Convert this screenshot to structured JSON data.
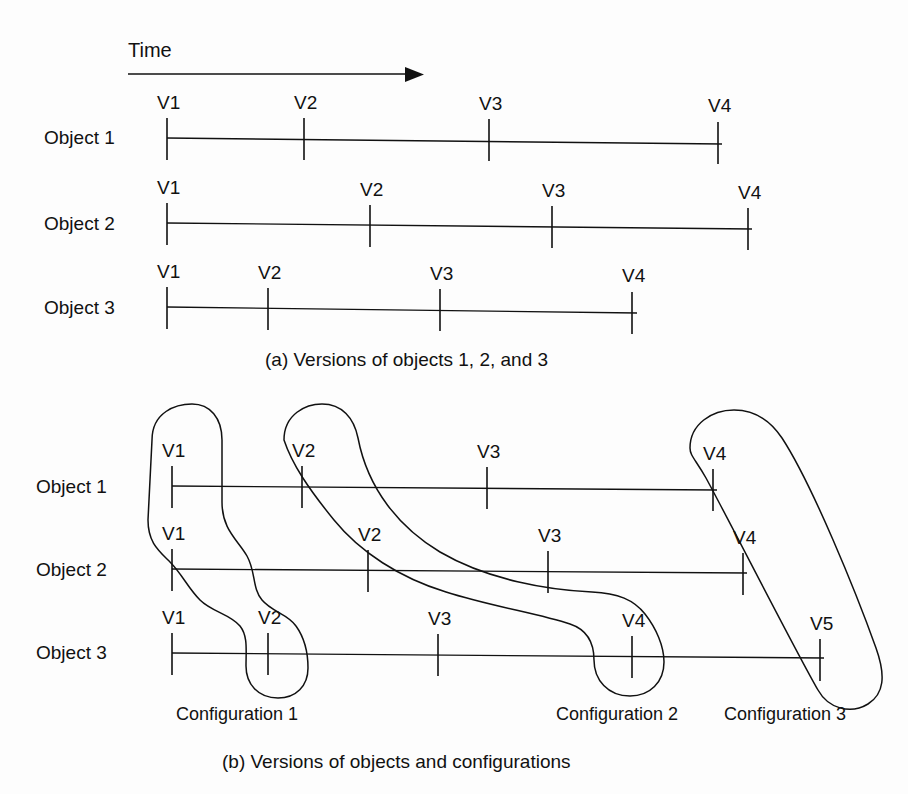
{
  "figure": {
    "time_axis": {
      "label": "Time",
      "label_x": 128,
      "label_y": 40,
      "line_x1": 128,
      "line_x2": 422,
      "line_y": 74
    },
    "panel_a": {
      "caption": "(a) Versions of objects 1, 2, and 3",
      "caption_x": 265,
      "caption_y": 350,
      "rows": [
        {
          "object_label": "Object 1",
          "label_x": 44,
          "label_y": 128,
          "line_y": 137,
          "line_x1": 167,
          "line_x2": 722,
          "versions": [
            {
              "name": "V1",
              "x": 167
            },
            {
              "name": "V2",
              "x": 304
            },
            {
              "name": "V3",
              "x": 489
            },
            {
              "name": "V4",
              "x": 718
            }
          ]
        },
        {
          "object_label": "Object 2",
          "label_x": 44,
          "label_y": 214,
          "line_y": 223,
          "line_x1": 167,
          "line_x2": 752,
          "versions": [
            {
              "name": "V1",
              "x": 167
            },
            {
              "name": "V2",
              "x": 370
            },
            {
              "name": "V3",
              "x": 552
            },
            {
              "name": "V4",
              "x": 748
            }
          ]
        },
        {
          "object_label": "Object 3",
          "label_x": 44,
          "label_y": 298,
          "line_y": 307,
          "line_x1": 167,
          "line_x2": 637,
          "versions": [
            {
              "name": "V1",
              "x": 167
            },
            {
              "name": "V2",
              "x": 268
            },
            {
              "name": "V3",
              "x": 440
            },
            {
              "name": "V4",
              "x": 632
            }
          ]
        }
      ]
    },
    "panel_b": {
      "caption": "(b) Versions of objects and configurations",
      "caption_x": 222,
      "caption_y": 752,
      "rows": [
        {
          "object_label": "Object 1",
          "label_x": 36,
          "label_y": 477,
          "line_y": 487,
          "line_x1": 172,
          "line_x2": 717,
          "versions": [
            {
              "name": "V1",
              "x": 172
            },
            {
              "name": "V2",
              "x": 302
            },
            {
              "name": "V3",
              "x": 487
            },
            {
              "name": "V4",
              "x": 713
            }
          ]
        },
        {
          "object_label": "Object 2",
          "label_x": 36,
          "label_y": 560,
          "line_y": 570,
          "line_x1": 172,
          "line_x2": 747,
          "versions": [
            {
              "name": "V1",
              "x": 172
            },
            {
              "name": "V2",
              "x": 368
            },
            {
              "name": "V3",
              "x": 548
            },
            {
              "name": "V4",
              "x": 743
            }
          ]
        },
        {
          "object_label": "Object 3",
          "label_x": 36,
          "label_y": 643,
          "line_y": 655,
          "line_x1": 172,
          "line_x2": 824,
          "versions": [
            {
              "name": "V1",
              "x": 172
            },
            {
              "name": "V2",
              "x": 268
            },
            {
              "name": "V3",
              "x": 438
            },
            {
              "name": "V4",
              "x": 632
            },
            {
              "name": "V5",
              "x": 820
            }
          ]
        }
      ],
      "configurations": [
        {
          "label": "Configuration 1",
          "label_x": 176,
          "label_y": 705,
          "members": [
            "Object 1 / V1",
            "Object 2 / V1",
            "Object 3 / V2"
          ]
        },
        {
          "label": "Configuration 2",
          "label_x": 556,
          "label_y": 705,
          "members": [
            "Object 1 / V2",
            "Object 2 / V2",
            "Object 3 / V4"
          ]
        },
        {
          "label": "Configuration 3",
          "label_x": 724,
          "label_y": 705,
          "members": [
            "Object 1 / V4",
            "Object 2 / V4",
            "Object 3 / V5"
          ]
        }
      ]
    },
    "colors": {
      "ink": "#111111",
      "paper": "#fdfdfd"
    }
  }
}
